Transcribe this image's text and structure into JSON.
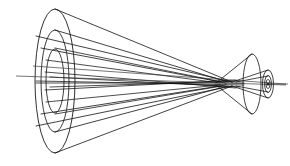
{
  "figure": {
    "title": "Converging wavefront cone diagram",
    "background_color": "#ffffff",
    "line_color": "#111111",
    "axis_color": "#3a3a3a"
  },
  "geometry": {
    "canvas": {
      "width": 290,
      "height": 166
    },
    "axis": {
      "y": 84,
      "x_start": 16,
      "x_end": 286
    },
    "left_aperture": {
      "center_x": 55,
      "center_y": 81,
      "wavefronts": [
        {
          "name": "outer-wavefront",
          "rx": 20,
          "ry": 72
        },
        {
          "name": "middle-wavefront",
          "rx": 14,
          "ry": 51
        },
        {
          "name": "inner-wavefront",
          "rx": 9,
          "ry": 32
        }
      ]
    },
    "caustic": {
      "primary_crossing_x": 216,
      "secondary_crossing_x": 232,
      "waist_start_x": 192,
      "waist_end_x": 248
    },
    "right_cone": {
      "mouth_center_x": 252,
      "mouth_center_y": 84,
      "mouth_rx": 9,
      "mouth_ry": 30,
      "focus_x": 268,
      "focus_y": 84,
      "wavefronts": [
        {
          "name": "small-outer-wavefront",
          "rx": 5.5,
          "ry": 14
        },
        {
          "name": "small-middle-wavefront",
          "rx": 3.4,
          "ry": 8.5
        },
        {
          "name": "small-inner-wavefront",
          "rx": 2.0,
          "ry": 4.6
        }
      ]
    },
    "ray_endpoints_left_y": [
      9,
      24,
      38,
      52,
      66,
      84,
      102,
      116,
      130,
      144,
      153
    ],
    "ray_count": 11
  }
}
